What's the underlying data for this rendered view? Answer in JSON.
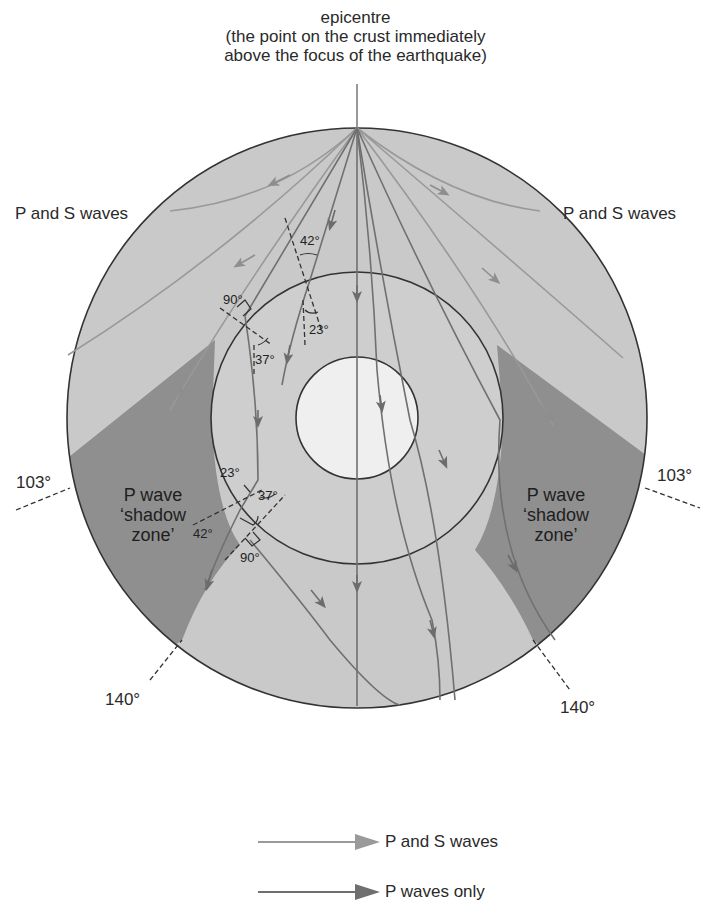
{
  "title": {
    "line1": "epicentre",
    "line2": "(the point on the crust immediately",
    "line3": "above the focus of the earthquake)"
  },
  "labels": {
    "ps_left": "P and S waves",
    "ps_right": "P and S waves",
    "deg103_left": "103°",
    "deg103_right": "103°",
    "deg140_left": "140°",
    "deg140_right": "140°"
  },
  "shadow_zones": {
    "left": {
      "line1": "P wave",
      "line2": "‘shadow",
      "line3": "zone’"
    },
    "right": {
      "line1": "P wave",
      "line2": "‘shadow",
      "line3": "zone’"
    }
  },
  "angles": {
    "upper_incident": "42°",
    "upper_refracted": "23°",
    "left_normal": "90°",
    "left_refracted": "37°",
    "lower_incident": "23°",
    "lower_exit": "37°",
    "lower_refracted": "42°",
    "lower_normal": "90°"
  },
  "legend": {
    "items": [
      {
        "label": "P and S waves",
        "color": "#9a9a9a"
      },
      {
        "label": "P waves only",
        "color": "#6f6f6f"
      }
    ]
  },
  "colors": {
    "mantle": "#c9c9c9",
    "outer_core": "#cdcdcd",
    "inner_core": "#efefef",
    "shadow": "#8f8f8f",
    "outline": "#333333",
    "ps_ray": "#9a9a9a",
    "p_ray": "#707070"
  }
}
